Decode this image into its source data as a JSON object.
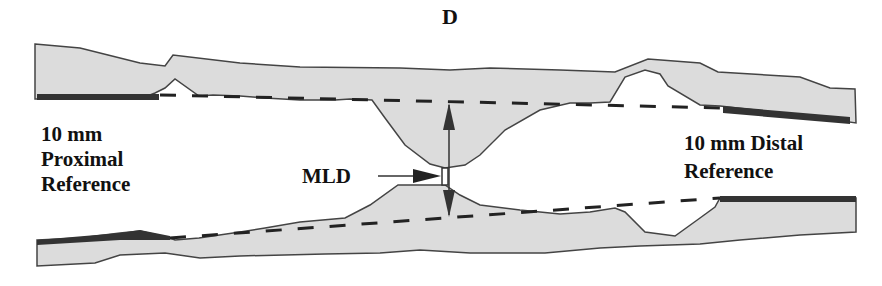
{
  "panel_label": "D",
  "labels": {
    "proximal_line1": "10 mm",
    "proximal_line2": "Proximal",
    "proximal_line3": "Reference",
    "distal_line1": "10 mm Distal",
    "distal_line2": "Reference",
    "mld": "MLD"
  },
  "colors": {
    "vessel_fill": "#dcdcdc",
    "outline": "#444444",
    "reference_bar": "#333333",
    "dashed_line": "#222222",
    "arrow": "#333333"
  }
}
